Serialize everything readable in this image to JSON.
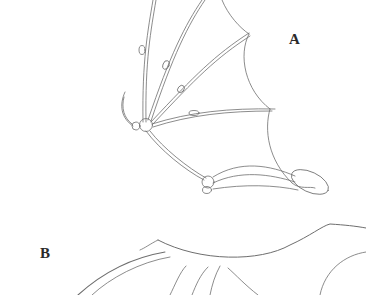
{
  "figure": {
    "panels": [
      {
        "id": "A",
        "label": "A",
        "description": "bat wing skeleton sketch with membrane"
      },
      {
        "id": "B",
        "label": "B",
        "description": "wing outline sketch, partially cropped"
      }
    ],
    "colors": {
      "background": "#ffffff",
      "stroke": "#6e6e6e",
      "label": "#2a2a2a"
    }
  }
}
